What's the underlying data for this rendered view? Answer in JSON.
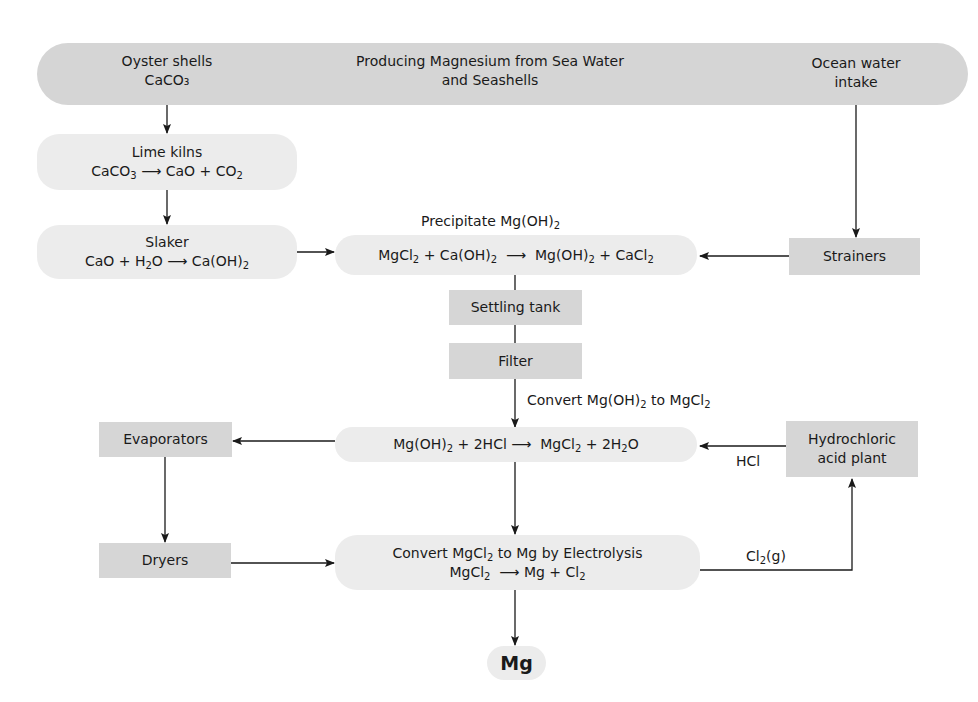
{
  "title": {
    "line1": "Producing Magnesium from Sea Water",
    "line2": "and Seashells"
  },
  "nodes": {
    "oyster": {
      "line1": "Oyster shells",
      "formula": "CaCO₃"
    },
    "ocean": {
      "line1": "Ocean water",
      "line2": "intake"
    },
    "lime_kilns": {
      "title": "Lime kilns",
      "reactant": "CaCO",
      "reactant_sub": "3",
      "arrow": "⟶",
      "product": "CaO + CO",
      "product_sub": "2"
    },
    "slaker": {
      "title": "Slaker",
      "eq_a": "CaO + H",
      "eq_a_sub": "2",
      "eq_b": "O",
      "arrow": "⟶",
      "product": "Ca(OH)",
      "product_sub": "2"
    },
    "precipitate": {
      "caption": "Precipitate Mg(OH)",
      "caption_sub": "2",
      "eq": [
        "MgCl",
        "2",
        " + Ca(OH)",
        "2",
        "  ⟶  ",
        "Mg(OH)",
        "2",
        " + CaCl",
        "2"
      ]
    },
    "strainers": {
      "label": "Strainers"
    },
    "settling_tank": {
      "label": "Settling tank"
    },
    "filter": {
      "label": "Filter"
    },
    "convert_hcl": {
      "caption": "Convert Mg(OH)",
      "caption_sub": "2",
      "caption_tail": " to MgCl",
      "caption_tail_sub": "2",
      "eq": [
        "Mg(OH)",
        "2",
        " + 2HCl ⟶  ",
        "MgCl",
        "2",
        " + 2H",
        "2",
        "O"
      ]
    },
    "evaporators": {
      "label": "Evaporators"
    },
    "hcl_plant": {
      "line1": "Hydrochloric",
      "line2": "acid plant"
    },
    "hcl_label": "HCl",
    "dryers": {
      "label": "Dryers"
    },
    "electrolysis": {
      "title": "Convert MgCl",
      "title_sub": "2",
      "title_tail": " to Mg by Electrolysis",
      "eq_a": "MgCl",
      "eq_a_sub": "2",
      "arrow": "  ⟶ ",
      "eq_b": "Mg + Cl",
      "eq_b_sub": "2"
    },
    "cl2_label": {
      "text": "Cl",
      "sub": "2",
      "tail": "(g)"
    },
    "mg": {
      "label": "Mg"
    }
  },
  "colors": {
    "banner": "#d5d5d5",
    "process_box": "#ececec",
    "equipment_box": "#d6d6d6",
    "line": "#1a1a1a"
  }
}
